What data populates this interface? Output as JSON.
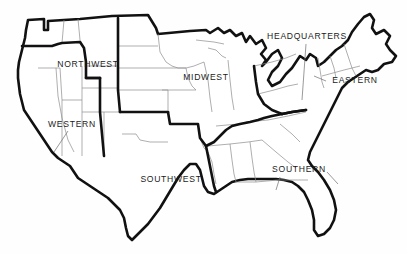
{
  "map": {
    "title": "United States Sales Regions Map",
    "background_color": "#fefefe",
    "outline_color": "#111111",
    "state_border_color": "#8c8c8c",
    "region_border_color": "#111111",
    "label_color": "#1b1b1b",
    "leader_line_color": "#6f6f6f",
    "width": 407,
    "height": 254,
    "regions": [
      {
        "id": "northwest",
        "label": "NORTHWEST",
        "label_x": 88,
        "label_y": 65,
        "has_leader": false
      },
      {
        "id": "midwest",
        "label": "MIDWEST",
        "label_x": 206,
        "label_y": 78,
        "has_leader": false
      },
      {
        "id": "headquarters",
        "label": "HEADQUARTERS",
        "label_x": 307,
        "label_y": 37,
        "has_leader": true
      },
      {
        "id": "eastern",
        "label": "EASTERN",
        "label_x": 355,
        "label_y": 81,
        "has_leader": true
      },
      {
        "id": "western",
        "label": "WESTERN",
        "label_x": 72,
        "label_y": 125,
        "has_leader": true
      },
      {
        "id": "southwest",
        "label": "SOUTHWEST",
        "label_x": 171,
        "label_y": 180,
        "has_leader": false
      },
      {
        "id": "southern",
        "label": "SOUTHERN",
        "label_x": 299,
        "label_y": 170,
        "has_leader": true
      }
    ]
  }
}
